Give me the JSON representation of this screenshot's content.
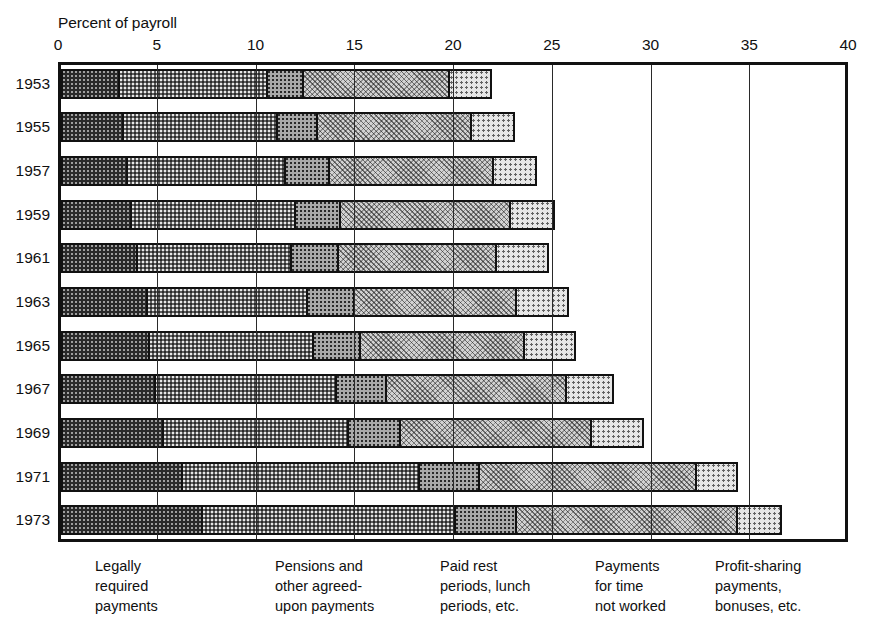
{
  "chart_data": {
    "type": "bar",
    "orientation": "horizontal",
    "stacked": true,
    "title": "",
    "xlabel": "Percent of payroll",
    "ylabel": "",
    "xlim": [
      0,
      40
    ],
    "xticks": [
      0,
      5,
      10,
      15,
      20,
      25,
      30,
      35,
      40
    ],
    "xticklabels": [
      "0",
      "5",
      "10",
      "15",
      "20",
      "25",
      "30",
      "35",
      "40"
    ],
    "grid": true,
    "grid_axis": "x",
    "legend_position": "bottom",
    "categories": [
      "1953",
      "1955",
      "1957",
      "1959",
      "1961",
      "1963",
      "1965",
      "1967",
      "1969",
      "1971",
      "1973"
    ],
    "series": [
      {
        "name": "Legally required payments",
        "legend_label": "Legally\nrequired\npayments",
        "fill": "dark-solid-halftone",
        "values": [
          3.0,
          3.2,
          3.4,
          3.6,
          3.9,
          4.4,
          4.5,
          4.8,
          5.2,
          6.2,
          7.2
        ]
      },
      {
        "name": "Pensions and other agreed-upon payments",
        "legend_label": "Pensions and\nother agreed-\nupon payments",
        "fill": "mid-dark-halftone",
        "values": [
          7.5,
          7.8,
          8.0,
          8.3,
          7.8,
          8.1,
          8.3,
          9.2,
          9.4,
          12.0,
          12.8
        ]
      },
      {
        "name": "Paid rest periods, lunch periods, etc.",
        "legend_label": "Paid rest\nperiods, lunch\nperiods, etc.",
        "fill": "mid-light-halftone",
        "values": [
          1.8,
          2.0,
          2.2,
          2.3,
          2.4,
          2.4,
          2.4,
          2.5,
          2.6,
          3.0,
          3.1
        ]
      },
      {
        "name": "Payments for time not worked",
        "legend_label": "Payments\nfor time\nnot worked",
        "fill": "cross-hatch",
        "values": [
          7.4,
          7.8,
          8.3,
          8.6,
          8.0,
          8.2,
          8.3,
          9.1,
          9.7,
          11.0,
          11.2
        ]
      },
      {
        "name": "Profit-sharing payments, bonuses, etc.",
        "legend_label": "Profit-sharing\npayments,\nbonuses, etc.",
        "fill": "light-dot",
        "values": [
          2.1,
          2.2,
          2.2,
          2.2,
          2.6,
          2.6,
          2.6,
          2.4,
          2.6,
          2.1,
          2.2
        ]
      }
    ],
    "totals": [
      21.8,
      23.0,
      24.1,
      25.0,
      24.7,
      25.7,
      26.1,
      28.0,
      29.5,
      34.3,
      36.5
    ]
  },
  "axis": {
    "title": "Percent of payroll"
  },
  "legend": {
    "items": [
      "Legally\nrequired\npayments",
      "Pensions and\nother agreed-\nupon payments",
      "Paid rest\nperiods, lunch\nperiods, etc.",
      "Payments\nfor time\nnot worked",
      "Profit-sharing\npayments,\nbonuses, etc."
    ]
  },
  "colors": {
    "axis": "#111111",
    "grid": "#2a2a2a",
    "text": "#101010",
    "segment_1": "#2a2a2a",
    "segment_2": "#5e5e5e",
    "segment_3": "#a9a9a9",
    "segment_4": "#d2d2d2",
    "segment_5": "#e6e6e6",
    "background": "#ffffff"
  }
}
